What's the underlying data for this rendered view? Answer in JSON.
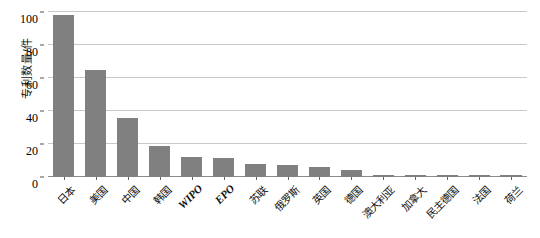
{
  "chart_data": {
    "type": "bar",
    "title": "",
    "subtitle": "",
    "xlabel": "",
    "ylabel": "专利数量/件",
    "ylim": [
      0,
      100
    ],
    "yticks": [
      0,
      20,
      40,
      60,
      80,
      100
    ],
    "grid": true,
    "legend": null,
    "bar_color": "#808080",
    "gridline_color": "#c9c9c9",
    "axis_color": "#8c8c8c",
    "categories": [
      "日本",
      "美国",
      "中国",
      "韩国",
      "WIPO",
      "EPO",
      "苏联",
      "俄罗斯",
      "英国",
      "德国",
      "澳大利亚",
      "加拿大",
      "民主德国",
      "法国",
      "荷兰"
    ],
    "values": [
      98,
      65,
      36,
      19,
      12,
      11.5,
      8,
      7,
      6,
      4,
      1.5,
      1.5,
      1.5,
      1.5,
      1.5
    ],
    "series": [
      {
        "name": "专利数量",
        "values": [
          98,
          65,
          36,
          19,
          12,
          11.5,
          8,
          7,
          6,
          4,
          1.5,
          1.5,
          1.5,
          1.5,
          1.5
        ]
      }
    ]
  },
  "axis": {
    "y_tick_labels": [
      "0",
      "20",
      "40",
      "60",
      "80",
      "100"
    ]
  }
}
